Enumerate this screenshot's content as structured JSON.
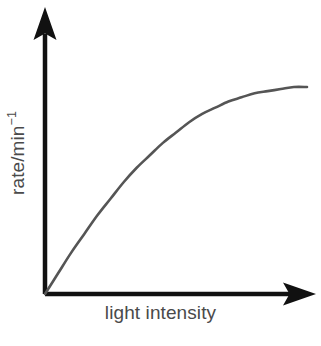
{
  "figure": {
    "background_color": "#ffffff",
    "axis_color": "#000000",
    "curve_color": "#555555",
    "label_color": "#4a4a4a"
  },
  "labels": {
    "x_axis": "light intensity",
    "y_axis_base": "rate/min",
    "y_axis_exponent": "−1",
    "y_axis_full": "rate/min⁻¹"
  },
  "icons": {
    "y_axis_arrow": "arrow-up-icon",
    "x_axis_arrow": "arrow-right-icon"
  },
  "chart_data": {
    "type": "line",
    "title": "",
    "subtitle": "",
    "xlabel": "light intensity",
    "ylabel": "rate/min⁻¹",
    "grid": false,
    "legend": false,
    "legend_position": "none",
    "axis_arrows": true,
    "tick_labels_x": [],
    "tick_labels_y": [],
    "xlim": [
      0,
      1
    ],
    "ylim": [
      0,
      1
    ],
    "annotations": [],
    "series": [
      {
        "name": "rate of photosynthesis",
        "description": "Saturation curve: rate rises steeply and near-linearly at low light intensity, then bends and plateaus at a maximum rate as light intensity increases.",
        "x": [
          0.0,
          0.05,
          0.1,
          0.15,
          0.2,
          0.25,
          0.3,
          0.35,
          0.4,
          0.45,
          0.5,
          0.55,
          0.6,
          0.65,
          0.7,
          0.75,
          0.8,
          0.85,
          0.9,
          0.95,
          1.0
        ],
        "y": [
          0.0,
          0.1,
          0.2,
          0.29,
          0.38,
          0.46,
          0.54,
          0.61,
          0.67,
          0.73,
          0.78,
          0.83,
          0.87,
          0.9,
          0.93,
          0.95,
          0.97,
          0.98,
          0.99,
          1.0,
          1.0
        ]
      }
    ]
  },
  "geometry": {
    "origin": {
      "x": 45,
      "y": 294
    },
    "y_axis_top": 8,
    "x_axis_right": 315,
    "curve_end": {
      "x": 307,
      "y": 87
    }
  }
}
